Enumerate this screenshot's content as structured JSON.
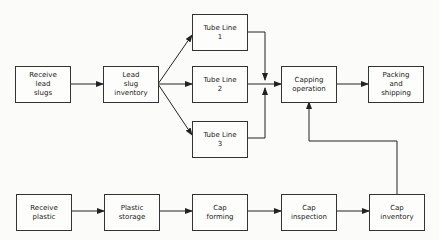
{
  "diagram": {
    "type": "process-flowchart",
    "nodes": [
      {
        "id": "receive-lead-slugs",
        "label": "Receive\nlead\nslugs"
      },
      {
        "id": "lead-slug-inventory",
        "label": "Lead\nslug\ninventory"
      },
      {
        "id": "tube-line-1",
        "label": "Tube Line\n1"
      },
      {
        "id": "tube-line-2",
        "label": "Tube Line\n2"
      },
      {
        "id": "tube-line-3",
        "label": "Tube Line\n3"
      },
      {
        "id": "capping-operation",
        "label": "Capping\noperation"
      },
      {
        "id": "packing-and-shipping",
        "label": "Packing\nand\nshipping"
      },
      {
        "id": "receive-plastic",
        "label": "Receive\nplastic"
      },
      {
        "id": "plastic-storage",
        "label": "Plastic\nstorage"
      },
      {
        "id": "cap-forming",
        "label": "Cap\nforming"
      },
      {
        "id": "cap-inspection",
        "label": "Cap\ninspection"
      },
      {
        "id": "cap-inventory",
        "label": "Cap\ninventory"
      }
    ],
    "edges": [
      [
        "receive-lead-slugs",
        "lead-slug-inventory"
      ],
      [
        "lead-slug-inventory",
        "tube-line-1"
      ],
      [
        "lead-slug-inventory",
        "tube-line-2"
      ],
      [
        "lead-slug-inventory",
        "tube-line-3"
      ],
      [
        "tube-line-1",
        "capping-operation"
      ],
      [
        "tube-line-2",
        "capping-operation"
      ],
      [
        "tube-line-3",
        "capping-operation"
      ],
      [
        "capping-operation",
        "packing-and-shipping"
      ],
      [
        "receive-plastic",
        "plastic-storage"
      ],
      [
        "plastic-storage",
        "cap-forming"
      ],
      [
        "cap-forming",
        "cap-inspection"
      ],
      [
        "cap-inspection",
        "cap-inventory"
      ],
      [
        "cap-inventory",
        "capping-operation"
      ]
    ]
  }
}
